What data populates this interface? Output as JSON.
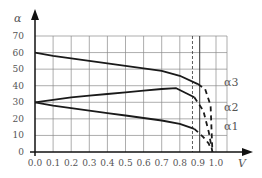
{
  "chart_data": {
    "type": "line",
    "title": "",
    "xlabel": "V",
    "ylabel": "α",
    "xlim": [
      0.0,
      1.0
    ],
    "ylim": [
      0,
      70
    ],
    "grid": true,
    "x_ticks": [
      "0.0",
      "0.1",
      "0.2",
      "0.3",
      "0.4",
      "0.5",
      "0.6",
      "0.7",
      "0.8",
      "0.9",
      "1.0"
    ],
    "y_ticks": [
      "0",
      "10",
      "20",
      "30",
      "40",
      "50",
      "60",
      "70"
    ],
    "vertical_lines": [
      {
        "x": 0.87,
        "style": "dashed"
      },
      {
        "x": 0.91,
        "style": "solid"
      }
    ],
    "series": [
      {
        "name": "α3",
        "solid": {
          "x": [
            0.0,
            0.1,
            0.2,
            0.3,
            0.4,
            0.5,
            0.6,
            0.7,
            0.8,
            0.9
          ],
          "y": [
            60,
            58,
            56.5,
            55,
            53.5,
            52,
            50.5,
            49,
            46,
            41
          ]
        },
        "dashed": {
          "x": [
            0.9,
            0.94,
            0.97,
            0.98
          ],
          "y": [
            41,
            38,
            28,
            0
          ]
        }
      },
      {
        "name": "α2",
        "solid": {
          "x": [
            0.0,
            0.1,
            0.2,
            0.3,
            0.4,
            0.5,
            0.6,
            0.7,
            0.78,
            0.88
          ],
          "y": [
            30,
            31.5,
            33,
            34,
            35,
            36,
            37,
            38,
            38.5,
            33
          ]
        },
        "dashed": {
          "x": [
            0.88,
            0.93,
            0.96,
            0.98
          ],
          "y": [
            33,
            25,
            12,
            0
          ]
        }
      },
      {
        "name": "α1",
        "solid": {
          "x": [
            0.0,
            0.1,
            0.2,
            0.3,
            0.4,
            0.5,
            0.6,
            0.7,
            0.8,
            0.88
          ],
          "y": [
            30,
            28,
            26.5,
            25,
            23.5,
            22,
            20.5,
            19,
            17,
            14
          ]
        },
        "dashed": {
          "x": [
            0.88,
            0.93,
            0.96,
            0.97
          ],
          "y": [
            14,
            9,
            5,
            2
          ]
        }
      }
    ],
    "legend": [
      "α3",
      "α2",
      "α1"
    ],
    "legend_position": "right"
  }
}
